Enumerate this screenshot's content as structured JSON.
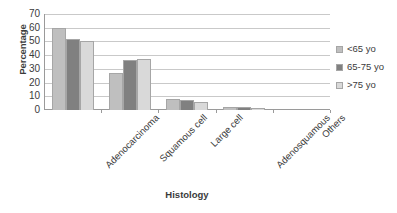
{
  "chart_data": {
    "type": "bar",
    "title": "",
    "subtitle": "",
    "xlabel": "Histology",
    "ylabel": "Percentage",
    "categories": [
      "Adenocarcinoma",
      "Squamous cell",
      "Large cell",
      "Adenosquamous",
      "Others"
    ],
    "series": [
      {
        "name": "<65 yo",
        "color": "#bfbfbf",
        "values": [
          60,
          27,
          8,
          2.5,
          0
        ]
      },
      {
        "name": "65-75 yo",
        "color": "#808080",
        "values": [
          52,
          36.5,
          7,
          2.5,
          0
        ]
      },
      {
        "name": ">75 yo",
        "color": "#d9d9d9",
        "values": [
          50,
          37.5,
          6,
          1.5,
          0
        ]
      }
    ],
    "ylim": [
      0,
      70
    ],
    "yticks": [
      0,
      10,
      20,
      30,
      40,
      50,
      60,
      70
    ],
    "ytick_labels": [
      "0",
      "10",
      "20",
      "30",
      "40",
      "50",
      "60",
      "70"
    ],
    "grid": "horizontal",
    "legend_position": "right",
    "bar_border_color": "#a6a6a6",
    "gridline_color": "#c9c9c9",
    "axis_color": "#9a9a9a",
    "background": "#ffffff"
  },
  "legend": {
    "items": [
      {
        "label": "<65 yo",
        "color": "#bfbfbf"
      },
      {
        "label": "65-75 yo",
        "color": "#808080"
      },
      {
        "label": ">75 yo",
        "color": "#d9d9d9"
      }
    ]
  }
}
